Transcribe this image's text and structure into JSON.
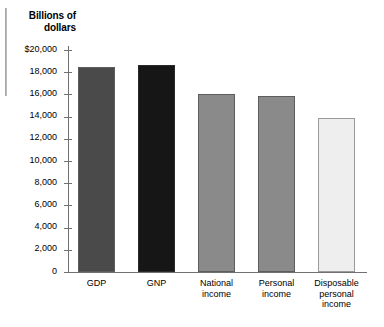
{
  "chart_data": {
    "type": "bar",
    "title": "Billions of dollars",
    "xlabel": "",
    "ylabel": "Billions of dollars",
    "ylim": [
      0,
      20000
    ],
    "grid": false,
    "legend": "none",
    "categories": [
      "GDP",
      "GNP",
      "National\nincome",
      "Personal\nincome",
      "Disposable\npersonal\nincome"
    ],
    "values": [
      18500,
      18650,
      16050,
      15900,
      13900
    ],
    "bar_colors": [
      "#4a4a4a",
      "#161616",
      "#8a8a8a",
      "#8a8a8a",
      "#eeeeee"
    ],
    "ytick_labels": [
      "$20,000",
      "18,000",
      "16,000",
      "14,000",
      "12,000",
      "10,000",
      "8,000",
      "6,000",
      "4,000",
      "2,000",
      "0"
    ],
    "ytick_values": [
      20000,
      18000,
      16000,
      14000,
      12000,
      10000,
      8000,
      6000,
      4000,
      2000,
      0
    ]
  }
}
